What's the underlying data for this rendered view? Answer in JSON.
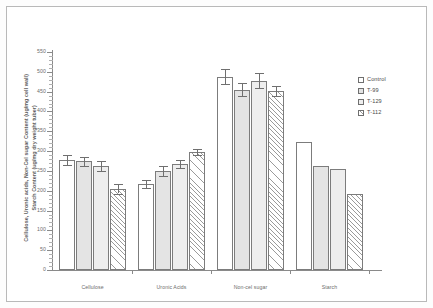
{
  "chart_data": {
    "type": "bar",
    "title": "",
    "xlabel": "",
    "ylabel_line1": "Cellulose, Uronic acids, Non-Cel sugar Content (ug/mg cell wall)",
    "ylabel_line2": "Starch Content (ug/mg dry weight tuber)",
    "categories": [
      "Cellulose",
      "Uronic Acids",
      "Non-cel sugar",
      "Starch"
    ],
    "ylim": [
      0,
      550
    ],
    "yticks": [
      0,
      50,
      100,
      150,
      200,
      250,
      300,
      350,
      400,
      450,
      500,
      550
    ],
    "ytick_labels": [
      "0",
      "50",
      "100",
      "150",
      "200",
      "250",
      "300",
      "350",
      "400",
      "450",
      "500",
      "550"
    ],
    "grid": false,
    "legend_position": "right",
    "series": [
      {
        "name": "Control",
        "pattern": "white",
        "values": [
          278,
          218,
          488,
          323
        ],
        "errors": [
          12,
          10,
          18,
          0
        ]
      },
      {
        "name": "T-99",
        "pattern": "gray",
        "values": [
          274,
          250,
          455,
          262
        ],
        "errors": [
          12,
          12,
          16,
          0
        ]
      },
      {
        "name": "T-129",
        "pattern": "lightgray",
        "values": [
          263,
          268,
          478,
          255
        ],
        "errors": [
          13,
          10,
          18,
          0
        ]
      },
      {
        "name": "T-112",
        "pattern": "hatch",
        "values": [
          205,
          297,
          452,
          193
        ],
        "errors": [
          12,
          8,
          12,
          0
        ]
      }
    ]
  },
  "legend": {
    "items": [
      {
        "label": "Control",
        "pattern": "white"
      },
      {
        "label": "T-99",
        "pattern": "gray"
      },
      {
        "label": "T-129",
        "pattern": "lightgray"
      },
      {
        "label": "T-112",
        "pattern": "hatch"
      }
    ]
  }
}
